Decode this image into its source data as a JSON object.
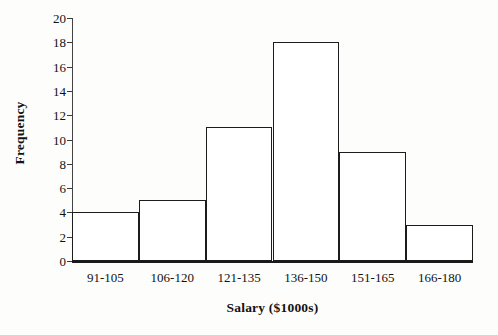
{
  "chart_data": {
    "type": "bar",
    "title": "",
    "subtitle": "",
    "xlabel": "Salary ($1000s)",
    "ylabel": "Frequency",
    "categories": [
      "91-105",
      "106-120",
      "121-135",
      "136-150",
      "151-165",
      "166-180"
    ],
    "values": [
      4,
      5,
      11,
      18,
      9,
      3
    ],
    "series": [
      {
        "name": "Frequency",
        "values": [
          4,
          5,
          11,
          18,
          9,
          3
        ]
      }
    ],
    "ylim": [
      0,
      20
    ],
    "ytick_labels": [
      "20",
      "18",
      "16",
      "14",
      "12",
      "10",
      "8",
      "6",
      "4",
      "2",
      "0"
    ],
    "ytick_values": [
      20,
      18,
      16,
      14,
      12,
      10,
      8,
      6,
      4,
      2,
      0
    ],
    "ytick_step": 2,
    "grid": false,
    "legend": false,
    "legend_position": "none",
    "bar_fill_color": "#ffffff",
    "bar_edge_color": "#1c1c1c",
    "axis_color": "#1a1a1a",
    "background_color": "#fdfdfc",
    "bar_gap": 0,
    "tick_direction": "out"
  }
}
